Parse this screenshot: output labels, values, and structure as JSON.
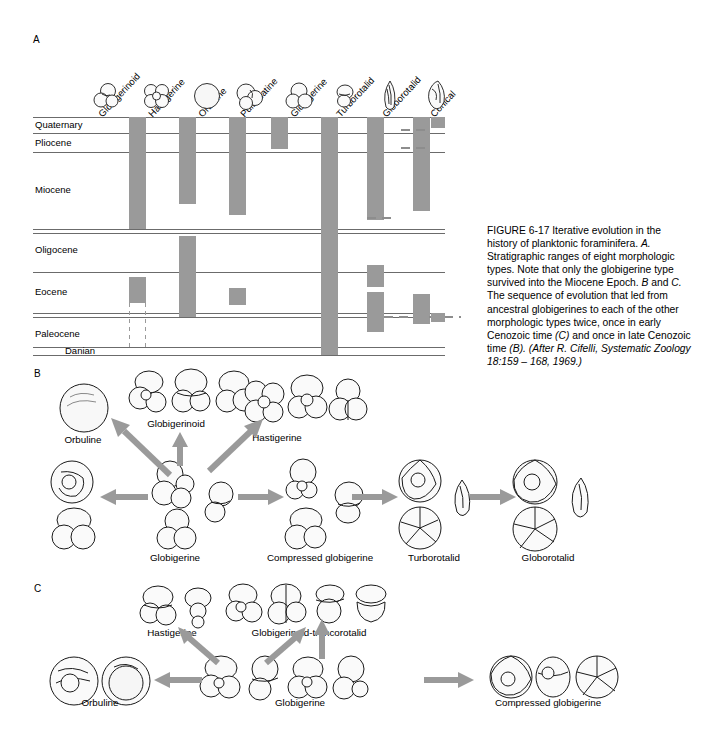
{
  "figure": {
    "caption_parts": [
      {
        "t": "FIGURE 6-17",
        "i": false
      },
      {
        "t": "     Iterative evolution in the history of planktonic foraminifera. ",
        "i": false
      },
      {
        "t": "A.",
        "i": true
      },
      {
        "t": " Stratigraphic ranges of eight morphologic types. Note that only the globigerine type survived into the Miocene Epoch. ",
        "i": false
      },
      {
        "t": "B",
        "i": true
      },
      {
        "t": " and ",
        "i": false
      },
      {
        "t": "C.",
        "i": true
      },
      {
        "t": " The sequence of evolution that led from ancestral globigerines to each of the other morphologic types twice, once in early Cenozoic time ",
        "i": false
      },
      {
        "t": "(C)",
        "i": true
      },
      {
        "t": " and once in late Cenozoic time ",
        "i": false
      },
      {
        "t": "(B).",
        "i": true
      },
      {
        "t": " ",
        "i": false
      },
      {
        "t": "(After R. Cifelli, Systematic Zoology 18:159 – 168, 1969.)",
        "i": true
      }
    ],
    "caption_plain": "FIGURE 6-17     Iterative evolution in the history of planktonic foraminifera. A. Stratigraphic ranges of eight morphologic types. Note that only the globigerine type survived into the Miocene Epoch. B and C. The sequence of evolution that led from ancestral globigerines to each of the other morphologic types twice, once in early Cenozoic time (C) and once in late Cenozoic time (B). (After R. Cifelli, Systematic Zoology 18:159 – 168, 1969.)"
  },
  "panel_a": {
    "letter": "A",
    "epochs": [
      {
        "name": "Quaternary",
        "top": 0,
        "bottom": 16
      },
      {
        "name": "Pliocene",
        "top": 16,
        "bottom": 35
      },
      {
        "name": "Miocene",
        "top": 35,
        "bottom": 112
      },
      {
        "name": "Oligocene",
        "top": 116,
        "bottom": 155
      },
      {
        "name": "Eocene",
        "top": 155,
        "bottom": 196
      },
      {
        "name": "Paleocene",
        "top": 200,
        "bottom": 230
      },
      {
        "name": "Danian",
        "top": 230,
        "bottom": 238
      }
    ],
    "columns": [
      {
        "name": "Globigerinoid",
        "x": 96
      },
      {
        "name": "Hastigerine",
        "x": 146
      },
      {
        "name": "Orbuline",
        "x": 196
      },
      {
        "name": "Pulleniatine",
        "x": 238
      },
      {
        "name": "Globigerine",
        "x": 288
      },
      {
        "name": "Turborotalid",
        "x": 334
      },
      {
        "name": "Globorotalid",
        "x": 380
      },
      {
        "name": "Conical",
        "x": 428
      }
    ],
    "ranges": [
      {
        "type": "Globigerinoid",
        "bars": [
          {
            "from": 0,
            "to": 112
          },
          {
            "from": 160,
            "to": 186
          }
        ]
      },
      {
        "type": "Hastigerine",
        "bars": [
          {
            "from": 0,
            "to": 87
          },
          {
            "from": 119,
            "to": 200
          }
        ]
      },
      {
        "type": "Orbuline",
        "bars": [
          {
            "from": 0,
            "to": 98
          },
          {
            "from": 171,
            "to": 188
          }
        ]
      },
      {
        "type": "Pulleniatine",
        "bars": [
          {
            "from": 0,
            "to": 32
          }
        ]
      },
      {
        "type": "Globigerine",
        "bars": [
          {
            "from": 0,
            "to": 238
          }
        ]
      },
      {
        "type": "Turborotalid",
        "bars": [
          {
            "from": 0,
            "to": 103
          },
          {
            "from": 148,
            "to": 170
          },
          {
            "from": 175,
            "to": 215
          }
        ]
      },
      {
        "type": "Globorotalid",
        "bars": [
          {
            "from": 0,
            "to": 94
          },
          {
            "from": 177,
            "to": 207
          }
        ]
      },
      {
        "type": "Conical",
        "bars": [
          {
            "from": 0,
            "to": 11
          },
          {
            "from": 196,
            "to": 205
          }
        ]
      }
    ],
    "dashed_ranges": [
      {
        "note": "conical-quaternary-tie"
      },
      {
        "note": "conical-pliocene-tie"
      },
      {
        "note": "turborotalid-miocene-tie"
      },
      {
        "note": "globorotalid-paleocene-tie"
      },
      {
        "note": "globigerinoid-paleocene-vertical"
      }
    ]
  },
  "panel_b": {
    "letter": "B",
    "nodes": [
      {
        "label": "Orbuline",
        "x": 83,
        "y": 74
      },
      {
        "label": "Globigerinoid",
        "x": 176,
        "y": 58
      },
      {
        "label": "Hastigerine",
        "x": 277,
        "y": 72
      },
      {
        "label": "Globigerine",
        "x": 175,
        "y": 192
      },
      {
        "label": "Compressed globigerine",
        "x": 320,
        "y": 192
      },
      {
        "label": "Turborotalid",
        "x": 434,
        "y": 192
      },
      {
        "label": "Globorotalid",
        "x": 548,
        "y": 192
      }
    ]
  },
  "panel_c": {
    "letter": "C",
    "nodes": [
      {
        "label": "Hastigerine",
        "x": 172,
        "y": 52
      },
      {
        "label": "Globigerinoid-truncorotalid",
        "x": 312,
        "y": 52
      },
      {
        "label": "Orbuline",
        "x": 80,
        "y": 122
      },
      {
        "label": "Globigerine",
        "x": 292,
        "y": 122
      },
      {
        "label": "Compressed globigerine",
        "x": 527,
        "y": 122
      }
    ]
  },
  "colors": {
    "bar_gray": "#9a9a9a",
    "line_gray": "#6b6b6b",
    "arrow_gray": "#9a9a9a",
    "shell_outline": "#1a1a1a",
    "text": "#000000"
  }
}
